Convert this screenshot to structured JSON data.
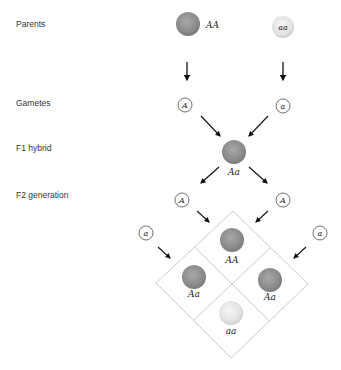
{
  "labels": {
    "parents": "Parents",
    "gametes": "Gametes",
    "f1": "F1 hybrid",
    "f2": "F2 generation"
  },
  "parents": {
    "left": {
      "genotype": "AA",
      "color": "#8f8f8f"
    },
    "right": {
      "genotype": "aa",
      "color": "#e4e4e4"
    }
  },
  "gametes": {
    "left": "A",
    "right": "a"
  },
  "f1": {
    "genotype": "Aa",
    "color": "#949494"
  },
  "f2_gametes": {
    "top_left": "A",
    "top_right": "A",
    "side_left": "a",
    "side_right": "a"
  },
  "punnett": {
    "top": {
      "genotype": "AA",
      "color": "#8f8f8f"
    },
    "left": {
      "genotype": "Aa",
      "color": "#8f8f8f"
    },
    "right": {
      "genotype": "Aa",
      "color": "#8f8f8f"
    },
    "bottom": {
      "genotype": "aa",
      "color": "#e4e4e4"
    },
    "line_color": "#c4c4c4"
  }
}
